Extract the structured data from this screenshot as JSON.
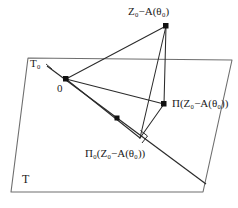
{
  "figure": {
    "type": "geometric-projection-diagram",
    "background_color": "#ffffff",
    "stroke_color": "#3a3a3a",
    "label_color": "#1a1a1a"
  },
  "labels": {
    "top_vertex": "Z₀−A(θ₀)",
    "projection_plane": "Π(Z₀−A(θ₀))",
    "projection_subspace": "Π₀(Z₀−A(θ₀))",
    "subspace_t0": "T₀",
    "origin": "0",
    "plane_t": "T"
  },
  "geometry": {
    "plane_quad": "28,58 232,60 203,192 11,192",
    "t0_line": {
      "x1": 47,
      "y1": 66,
      "x2": 206,
      "y2": 184
    },
    "points": {
      "origin": {
        "x": 66,
        "y": 79
      },
      "top_vertex": {
        "x": 166,
        "y": 26
      },
      "projection_plane": {
        "x": 164,
        "y": 104
      },
      "projection_subspace": {
        "x": 140,
        "y": 138
      },
      "t0_marker": {
        "x": 117,
        "y": 118
      }
    },
    "edges": [
      {
        "name": "origin-to-top-vertex",
        "from": "origin",
        "to": "top_vertex"
      },
      {
        "name": "origin-to-projection-plane",
        "from": "origin",
        "to": "projection_plane"
      },
      {
        "name": "origin-to-projection-sub",
        "from": "origin",
        "to": "projection_subspace"
      },
      {
        "name": "top-vertex-to-projection-plane",
        "from": "top_vertex",
        "to": "projection_plane"
      },
      {
        "name": "top-vertex-to-projection-sub",
        "from": "top_vertex",
        "to": "projection_subspace"
      },
      {
        "name": "projection-plane-to-projection-sub",
        "from": "projection_plane",
        "to": "projection_subspace"
      }
    ],
    "right_angle_marker": {
      "x": 140,
      "y": 138,
      "size": 7
    }
  }
}
